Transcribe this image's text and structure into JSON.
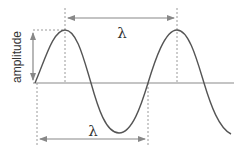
{
  "diagram": {
    "labels": {
      "amplitude": "amplitude",
      "wavelength_top": "λ",
      "wavelength_bottom": "λ"
    },
    "colors": {
      "wave": "#555555",
      "axis": "#888888",
      "arrow": "#888888",
      "dashed": "#999999",
      "text": "#333333"
    },
    "geometry": {
      "axis_y": 83,
      "axis_x_start": 33,
      "axis_x_end": 234,
      "wave_start_x": 35,
      "wavelength_px": 112,
      "amplitude_px": 52,
      "peak_1_x": 65,
      "peak_2_x": 177,
      "trough_x": 119
    }
  }
}
